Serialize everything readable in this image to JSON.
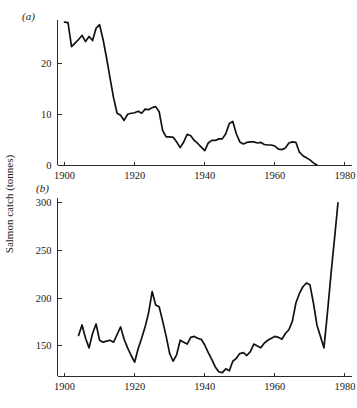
{
  "figure": {
    "ylabel": "Salmon catch (tonnes)",
    "panel_a_label": "(a)",
    "panel_b_label": "(b)"
  },
  "chart_data": [
    {
      "type": "line",
      "panel": "(a)",
      "title": "",
      "xlabel": "",
      "ylabel": "Salmon catch (tonnes)",
      "xlim": [
        1898,
        1982
      ],
      "ylim": [
        0,
        29
      ],
      "xticks": [
        1900,
        1920,
        1940,
        1960,
        1980
      ],
      "xtick_labels": [
        "1900",
        "1920",
        "1940",
        "1960",
        "1980"
      ],
      "yticks": [
        0,
        10,
        20
      ],
      "ytick_labels": [
        "0",
        "10",
        "20"
      ],
      "grid": false,
      "legend": "none",
      "series": [
        {
          "name": "Salmon catch (a)",
          "x": [
            1900,
            1901,
            1902,
            1903,
            1904,
            1905,
            1906,
            1907,
            1908,
            1909,
            1910,
            1911,
            1912,
            1913,
            1914,
            1915,
            1916,
            1917,
            1918,
            1919,
            1920,
            1921,
            1922,
            1923,
            1924,
            1925,
            1926,
            1927,
            1928,
            1929,
            1930,
            1931,
            1932,
            1933,
            1934,
            1935,
            1936,
            1937,
            1938,
            1939,
            1940,
            1941,
            1942,
            1943,
            1944,
            1945,
            1946,
            1947,
            1948,
            1949,
            1950,
            1951,
            1952,
            1953,
            1954,
            1955,
            1956,
            1957,
            1958,
            1959,
            1960,
            1961,
            1962,
            1963,
            1964,
            1965,
            1966,
            1967,
            1968,
            1969,
            1970,
            1971,
            1972
          ],
          "y": [
            28.0,
            27.9,
            23.2,
            23.9,
            24.6,
            25.4,
            24.2,
            25.2,
            24.4,
            26.8,
            27.5,
            24.6,
            21.0,
            17.0,
            13.2,
            10.2,
            9.8,
            8.8,
            10.0,
            10.2,
            10.3,
            10.6,
            10.2,
            11.0,
            10.9,
            11.3,
            11.5,
            10.5,
            6.8,
            5.6,
            5.6,
            5.5,
            4.6,
            3.5,
            4.6,
            6.1,
            5.8,
            4.9,
            4.3,
            3.6,
            2.9,
            4.4,
            4.9,
            4.9,
            5.2,
            5.2,
            6.2,
            8.2,
            8.6,
            6.2,
            4.6,
            4.2,
            4.5,
            4.6,
            4.6,
            4.4,
            4.5,
            4.1,
            4.0,
            4.0,
            3.8,
            3.2,
            3.1,
            3.4,
            4.4,
            4.6,
            4.5,
            2.6,
            1.9,
            1.5,
            1.1,
            0.5,
            0.1
          ]
        }
      ]
    },
    {
      "type": "line",
      "panel": "(b)",
      "title": "",
      "xlabel": "",
      "ylabel": "Salmon catch (tonnes)",
      "xlim": [
        1898,
        1982
      ],
      "ylim": [
        118,
        305
      ],
      "xticks": [
        1900,
        1920,
        1940,
        1960,
        1980
      ],
      "xtick_labels": [
        "1900",
        "1920",
        "1940",
        "1960",
        "1980"
      ],
      "yticks": [
        150,
        200,
        250,
        300
      ],
      "ytick_labels": [
        "150",
        "200",
        "250",
        "300"
      ],
      "grid": false,
      "legend": "none",
      "series": [
        {
          "name": "Salmon catch (b)",
          "x": [
            1904,
            1905,
            1906,
            1907,
            1908,
            1909,
            1910,
            1911,
            1912,
            1913,
            1914,
            1915,
            1916,
            1917,
            1918,
            1919,
            1920,
            1921,
            1922,
            1923,
            1924,
            1925,
            1926,
            1927,
            1928,
            1929,
            1930,
            1931,
            1932,
            1933,
            1934,
            1935,
            1936,
            1937,
            1938,
            1939,
            1940,
            1941,
            1942,
            1943,
            1944,
            1945,
            1946,
            1947,
            1948,
            1949,
            1950,
            1951,
            1952,
            1953,
            1954,
            1955,
            1956,
            1957,
            1958,
            1959,
            1960,
            1961,
            1962,
            1963,
            1964,
            1965,
            1966,
            1967,
            1968,
            1969,
            1970,
            1971,
            1972,
            1973,
            1974,
            1975,
            1976,
            1977,
            1978
          ],
          "y": [
            161,
            172,
            158,
            148,
            163,
            173,
            156,
            154,
            155,
            156,
            154,
            162,
            170,
            157,
            148,
            140,
            133,
            147,
            158,
            170,
            185,
            207,
            193,
            191,
            176,
            160,
            142,
            134,
            141,
            156,
            154,
            152,
            159,
            160,
            158,
            157,
            151,
            143,
            136,
            128,
            123,
            122,
            126,
            124,
            134,
            137,
            142,
            143,
            140,
            144,
            152,
            150,
            148,
            153,
            156,
            158,
            160,
            159,
            157,
            163,
            167,
            176,
            195,
            205,
            212,
            216,
            214,
            195,
            172,
            160,
            148,
            185,
            225,
            262,
            300
          ]
        }
      ]
    }
  ]
}
